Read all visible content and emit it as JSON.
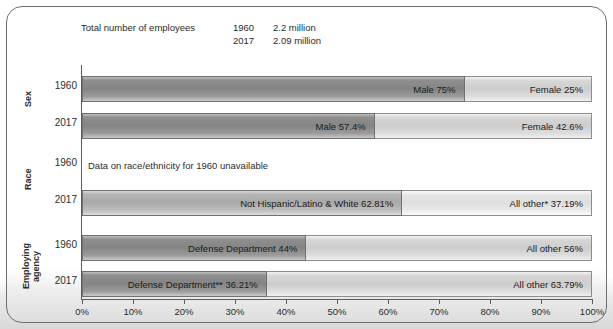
{
  "note": {
    "label": "Total number of employees",
    "rows": [
      {
        "year": "1960",
        "value": "2.2 million"
      },
      {
        "year": "2017",
        "value": "2.09 million"
      }
    ]
  },
  "axis": {
    "ticks": [
      "0%",
      "10%",
      "20%",
      "30%",
      "40%",
      "50%",
      "60%",
      "70%",
      "80%",
      "90%",
      "100%"
    ]
  },
  "groups": [
    {
      "name": "Sex"
    },
    {
      "name": "Race"
    },
    {
      "name": "Employing agency"
    }
  ],
  "years": {
    "sex_1960": "1960",
    "sex_2017": "2017",
    "race_1960": "1960",
    "race_2017": "2017",
    "agency_1960": "1960",
    "agency_2017": "2017"
  },
  "labels": {
    "sex_1960_a": "Male 75%",
    "sex_1960_b": "Female 25%",
    "sex_2017_a": "Male 57.4%",
    "sex_2017_b": "Female 42.6%",
    "race_1960_note": "Data on race/ethnicity for 1960 unavailable",
    "race_2017_a": "Not Hispanic/Latino & White 62.81%",
    "race_2017_b": "All other* 37.19%",
    "agency_1960_a": "Defense Department 44%",
    "agency_1960_b": "All other 56%",
    "agency_2017_a": "Defense Department** 36.21%",
    "agency_2017_b": "All other 63.79%"
  },
  "colors": {
    "panel_border": "#6f6f6f",
    "axis": "#5d5d5d",
    "segment_a": "#8f8f8f",
    "segment_b": "#d6d6d6",
    "text": "#2b2b2b"
  },
  "chart_data": {
    "type": "bar",
    "title": "",
    "xlabel": "",
    "ylabel": "",
    "xlim": [
      0,
      100
    ],
    "grid": false,
    "orientation": "horizontal",
    "stacked": true,
    "legend": "none",
    "annotations": [
      "Total number of employees 1960 2.2 million",
      "Total number of employees 2017 2.09 million",
      "Data on race/ethnicity for 1960 unavailable"
    ],
    "groups": [
      {
        "group": "Sex",
        "bars": [
          {
            "category": "1960",
            "segments": [
              {
                "label": "Male 75%",
                "value": 75
              },
              {
                "label": "Female 25%",
                "value": 25
              }
            ]
          },
          {
            "category": "2017",
            "segments": [
              {
                "label": "Male 57.4%",
                "value": 57.4
              },
              {
                "label": "Female 42.6%",
                "value": 42.6
              }
            ]
          }
        ]
      },
      {
        "group": "Race",
        "bars": [
          {
            "category": "1960",
            "segments": [],
            "note": "Data on race/ethnicity for 1960 unavailable"
          },
          {
            "category": "2017",
            "segments": [
              {
                "label": "Not Hispanic/Latino & White 62.81%",
                "value": 62.81
              },
              {
                "label": "All other* 37.19%",
                "value": 37.19
              }
            ]
          }
        ]
      },
      {
        "group": "Employing agency",
        "bars": [
          {
            "category": "1960",
            "segments": [
              {
                "label": "Defense Department 44%",
                "value": 44
              },
              {
                "label": "All other 56%",
                "value": 56
              }
            ]
          },
          {
            "category": "2017",
            "segments": [
              {
                "label": "Defense Department** 36.21%",
                "value": 36.21
              },
              {
                "label": "All other 63.79%",
                "value": 63.79
              }
            ]
          }
        ]
      }
    ]
  }
}
